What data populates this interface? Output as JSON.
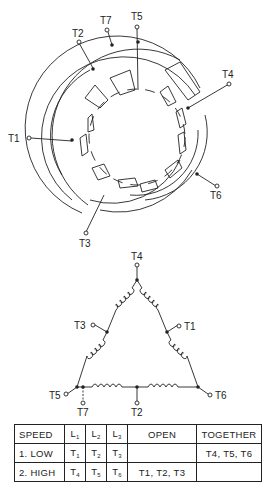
{
  "stator_diagram": {
    "terminals": [
      "T1",
      "T2",
      "T3",
      "T4",
      "T5",
      "T6",
      "T7"
    ]
  },
  "delta_diagram": {
    "terminals": {
      "top": "T4",
      "left_mid": "T3",
      "right_mid": "T1",
      "bottom_left": "T5",
      "bottom_left_tap": "T7",
      "bottom_mid": "T2",
      "bottom_right": "T6"
    }
  },
  "connection_table": {
    "headers": [
      "SPEED",
      "L",
      "L",
      "L",
      "OPEN",
      "TOGETHER"
    ],
    "header_subs": [
      "",
      "1",
      "2",
      "3",
      "",
      ""
    ],
    "rows": [
      {
        "speed": "1. LOW",
        "l1": "T",
        "l1_sub": "1",
        "l2": "T",
        "l2_sub": "2",
        "l3": "T",
        "l3_sub": "3",
        "open": "",
        "together": "T4, T5, T6"
      },
      {
        "speed": "2. HIGH",
        "l1": "T",
        "l1_sub": "4",
        "l2": "T",
        "l2_sub": "5",
        "l3": "T",
        "l3_sub": "6",
        "open": "T1, T2, T3",
        "together": ""
      }
    ]
  }
}
